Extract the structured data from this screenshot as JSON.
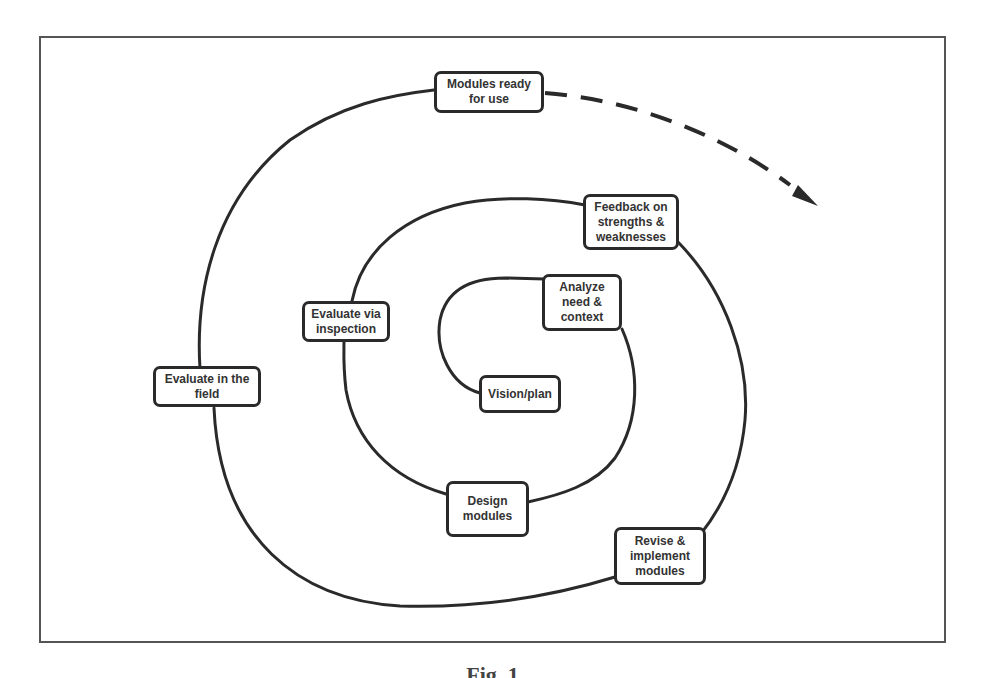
{
  "figure": {
    "caption": "Fig. 1",
    "colors": {
      "stroke": "#2a2a2a",
      "frame": "#555555",
      "text": "#333333",
      "background": "#ffffff"
    }
  },
  "nodes": [
    {
      "id": "vision",
      "label": "Vision/plan"
    },
    {
      "id": "analyze",
      "label": "Analyze\nneed &\ncontext"
    },
    {
      "id": "design",
      "label": "Design\nmodules"
    },
    {
      "id": "inspect",
      "label": "Evaluate via\ninspection"
    },
    {
      "id": "feedback",
      "label": "Feedback on\nstrengths &\nweaknesses"
    },
    {
      "id": "revise",
      "label": "Revise &\nimplement\nmodules"
    },
    {
      "id": "field",
      "label": "Evaluate in the\nfield"
    },
    {
      "id": "ready",
      "label": "Modules ready\nfor use"
    }
  ],
  "connectors": {
    "spiral": "solid",
    "continuation": "dashed-arrow"
  }
}
